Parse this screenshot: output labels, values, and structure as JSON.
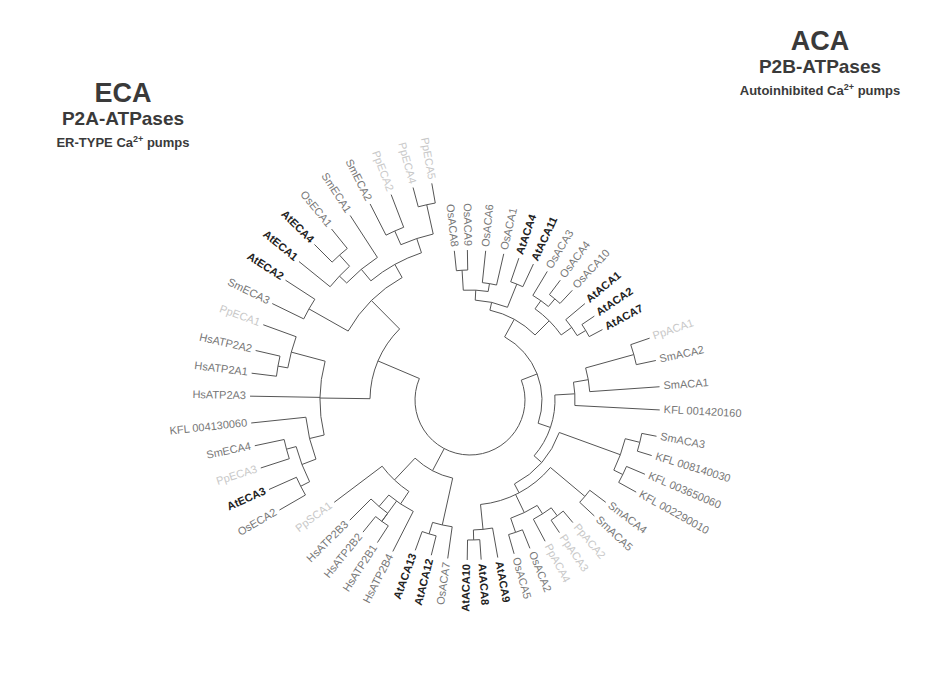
{
  "titles": {
    "eca": {
      "main": "ECA",
      "sub": "P2A-ATPases",
      "desc_pre": "ER-TYPE Ca",
      "desc_sup": "2+",
      "desc_post": " pumps"
    },
    "aca": {
      "main": "ACA",
      "sub": "P2B-ATPases",
      "desc_pre": "Autoinhibited  Ca",
      "desc_sup": "2+",
      "desc_post": " pumps"
    }
  },
  "colors": {
    "branch": "#555555",
    "at_label": "#222222",
    "other_label": "#777777",
    "faint_label": "#c8c8c8",
    "title": "#3a3a3a"
  },
  "tree": {
    "center": [
      470,
      400
    ],
    "root_radius": 55,
    "leaves": [
      {
        "name": "OsACA8",
        "angle": -96,
        "r": 150,
        "style": "other"
      },
      {
        "name": "OsACA9",
        "angle": -91,
        "r": 150,
        "style": "other"
      },
      {
        "name": "OsACA6",
        "angle": -84,
        "r": 150,
        "style": "other"
      },
      {
        "name": "OsACA1",
        "angle": -77,
        "r": 150,
        "style": "other"
      },
      {
        "name": "AtACA4",
        "angle": -71,
        "r": 150,
        "style": "at"
      },
      {
        "name": "AtACA11",
        "angle": -65,
        "r": 150,
        "style": "at"
      },
      {
        "name": "OsACA3",
        "angle": -59,
        "r": 150,
        "style": "other"
      },
      {
        "name": "OsACA4",
        "angle": -53,
        "r": 150,
        "style": "other"
      },
      {
        "name": "OsACA10",
        "angle": -47,
        "r": 150,
        "style": "other"
      },
      {
        "name": "AtACA1",
        "angle": -40,
        "r": 150,
        "style": "at"
      },
      {
        "name": "AtACA2",
        "angle": -34,
        "r": 150,
        "style": "at"
      },
      {
        "name": "AtACA7",
        "angle": -28,
        "r": 150,
        "style": "at"
      },
      {
        "name": "PpACA1",
        "angle": -19,
        "r": 190,
        "style": "faint"
      },
      {
        "name": "SmACA2",
        "angle": -12,
        "r": 190,
        "style": "other"
      },
      {
        "name": "SmACA1",
        "angle": -4,
        "r": 190,
        "style": "other"
      },
      {
        "name": "KFL 001420160",
        "angle": 3,
        "r": 190,
        "style": "other"
      },
      {
        "name": "SmACA3",
        "angle": 11,
        "r": 190,
        "style": "other"
      },
      {
        "name": "KFL 008140030",
        "angle": 17,
        "r": 190,
        "style": "other"
      },
      {
        "name": "KFL 003650060",
        "angle": 23,
        "r": 190,
        "style": "other"
      },
      {
        "name": "KFL 002290010",
        "angle": 29,
        "r": 190,
        "style": "other"
      },
      {
        "name": "SmACA4",
        "angle": 37,
        "r": 170,
        "style": "other"
      },
      {
        "name": "SmACA5",
        "angle": 43,
        "r": 170,
        "style": "other"
      },
      {
        "name": "PpACA2",
        "angle": 50,
        "r": 160,
        "style": "faint"
      },
      {
        "name": "PpACA3",
        "angle": 56,
        "r": 160,
        "style": "faint"
      },
      {
        "name": "PpACA4",
        "angle": 62,
        "r": 160,
        "style": "faint"
      },
      {
        "name": "OsACA2",
        "angle": 68,
        "r": 160,
        "style": "other"
      },
      {
        "name": "OsACA5",
        "angle": 74,
        "r": 160,
        "style": "other"
      },
      {
        "name": "AtACA9",
        "angle": 80,
        "r": 160,
        "style": "at"
      },
      {
        "name": "AtACA8",
        "angle": 86,
        "r": 160,
        "style": "at"
      },
      {
        "name": "AtACA10",
        "angle": 91,
        "r": 160,
        "style": "at"
      },
      {
        "name": "OsACA7",
        "angle": 98,
        "r": 160,
        "style": "other"
      },
      {
        "name": "AtACA12",
        "angle": 104,
        "r": 160,
        "style": "at"
      },
      {
        "name": "AtACA13",
        "angle": 110,
        "r": 160,
        "style": "at"
      },
      {
        "name": "HsATP2B4",
        "angle": 117,
        "r": 170,
        "style": "other"
      },
      {
        "name": "HsATP2B1",
        "angle": 123,
        "r": 170,
        "style": "other"
      },
      {
        "name": "HsATP2B2",
        "angle": 129,
        "r": 170,
        "style": "other"
      },
      {
        "name": "HsATP2B3",
        "angle": 135,
        "r": 170,
        "style": "other"
      },
      {
        "name": "PpSCA1",
        "angle": 143,
        "r": 170,
        "style": "faint"
      },
      {
        "name": "OsECA2",
        "angle": 150,
        "r": 220,
        "style": "other"
      },
      {
        "name": "AtECA3",
        "angle": 156,
        "r": 220,
        "style": "at"
      },
      {
        "name": "PpECA3",
        "angle": 162,
        "r": 220,
        "style": "faint"
      },
      {
        "name": "SmECA4",
        "angle": 168,
        "r": 220,
        "style": "other"
      },
      {
        "name": "KFL 004130060",
        "angle": 174,
        "r": 220,
        "style": "other"
      },
      {
        "name": "HsATP2A3",
        "angle": 181,
        "r": 220,
        "style": "other"
      },
      {
        "name": "HsATP2A1",
        "angle": 187,
        "r": 220,
        "style": "other"
      },
      {
        "name": "HsATP2A2",
        "angle": 193,
        "r": 220,
        "style": "other"
      },
      {
        "name": "PpECA1",
        "angle": 200,
        "r": 220,
        "style": "faint"
      },
      {
        "name": "SmECA3",
        "angle": 206,
        "r": 220,
        "style": "other"
      },
      {
        "name": "AtECA2",
        "angle": 213,
        "r": 220,
        "style": "at"
      },
      {
        "name": "AtECA1",
        "angle": 219,
        "r": 220,
        "style": "at"
      },
      {
        "name": "AtECA4",
        "angle": 225,
        "r": 220,
        "style": "at"
      },
      {
        "name": "OsECA1",
        "angle": 231,
        "r": 220,
        "style": "other"
      },
      {
        "name": "SmECA1",
        "angle": 237,
        "r": 220,
        "style": "other"
      },
      {
        "name": "SmECA2",
        "angle": 243,
        "r": 220,
        "style": "other"
      },
      {
        "name": "PpECA2",
        "angle": 249,
        "r": 220,
        "style": "faint"
      },
      {
        "name": "PpECA4",
        "angle": 255,
        "r": 220,
        "style": "faint"
      },
      {
        "name": "PpECA5",
        "angle": 260,
        "r": 220,
        "style": "faint"
      }
    ],
    "clades": [
      {
        "from": 0,
        "to": 1,
        "r": 130
      },
      {
        "from": 2,
        "to": 3,
        "r": 118
      },
      {
        "from": 0,
        "to": 3,
        "r": 110
      },
      {
        "from": 4,
        "to": 5,
        "r": 125
      },
      {
        "from": 0,
        "to": 5,
        "r": 100
      },
      {
        "from": 7,
        "to": 8,
        "r": 132
      },
      {
        "from": 6,
        "to": 8,
        "r": 122
      },
      {
        "from": 10,
        "to": 11,
        "r": 135
      },
      {
        "from": 9,
        "to": 11,
        "r": 125
      },
      {
        "from": 6,
        "to": 11,
        "r": 112
      },
      {
        "from": 0,
        "to": 11,
        "r": 92
      },
      {
        "from": 12,
        "to": 13,
        "r": 170
      },
      {
        "from": 12,
        "to": 14,
        "r": 120
      },
      {
        "from": 12,
        "to": 15,
        "r": 105
      },
      {
        "from": 16,
        "to": 17,
        "r": 175
      },
      {
        "from": 18,
        "to": 19,
        "r": 170
      },
      {
        "from": 16,
        "to": 19,
        "r": 160
      },
      {
        "from": 20,
        "to": 21,
        "r": 150
      },
      {
        "from": 22,
        "to": 23,
        "r": 145
      },
      {
        "from": 22,
        "to": 24,
        "r": 135
      },
      {
        "from": 25,
        "to": 26,
        "r": 140
      },
      {
        "from": 22,
        "to": 26,
        "r": 125
      },
      {
        "from": 28,
        "to": 29,
        "r": 140
      },
      {
        "from": 27,
        "to": 29,
        "r": 130
      },
      {
        "from": 27,
        "to": 26,
        "r": 118
      },
      {
        "from": 20,
        "to": 29,
        "r": 105
      },
      {
        "from": 16,
        "to": 29,
        "r": 95
      },
      {
        "from": 12,
        "to": 29,
        "r": 85
      },
      {
        "from": 0,
        "to": 29,
        "r": 72
      },
      {
        "from": 31,
        "to": 32,
        "r": 140
      },
      {
        "from": 30,
        "to": 32,
        "r": 128
      },
      {
        "from": 34,
        "to": 35,
        "r": 150
      },
      {
        "from": 35,
        "to": 36,
        "r": 140
      },
      {
        "from": 33,
        "to": 36,
        "r": 125
      },
      {
        "from": 33,
        "to": 37,
        "r": 110
      },
      {
        "from": 30,
        "to": 37,
        "r": 80
      },
      {
        "from": 38,
        "to": 39,
        "r": 190
      },
      {
        "from": 40,
        "to": 41,
        "r": 190
      },
      {
        "from": 38,
        "to": 41,
        "r": 180
      },
      {
        "from": 38,
        "to": 42,
        "r": 165
      },
      {
        "from": 44,
        "to": 45,
        "r": 195
      },
      {
        "from": 44,
        "to": 46,
        "r": 185
      },
      {
        "from": 38,
        "to": 46,
        "r": 150
      },
      {
        "from": 47,
        "to": 48,
        "r": 185
      },
      {
        "from": 50,
        "to": 51,
        "r": 195
      },
      {
        "from": 49,
        "to": 51,
        "r": 180
      },
      {
        "from": 49,
        "to": 52,
        "r": 170
      },
      {
        "from": 53,
        "to": 54,
        "r": 185
      },
      {
        "from": 55,
        "to": 56,
        "r": 200
      },
      {
        "from": 53,
        "to": 56,
        "r": 170
      },
      {
        "from": 49,
        "to": 56,
        "r": 155
      },
      {
        "from": 47,
        "to": 56,
        "r": 140
      },
      {
        "from": 38,
        "to": 56,
        "r": 100
      },
      {
        "from": 0,
        "to": 56,
        "r": 55
      }
    ]
  }
}
